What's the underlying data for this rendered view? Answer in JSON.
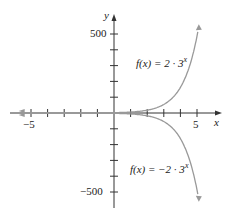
{
  "chart_data": {
    "type": "line",
    "title": "",
    "xlabel": "x",
    "ylabel": "y",
    "xlim": [
      -5.5,
      6
    ],
    "ylim": [
      -550,
      550
    ],
    "x_ticks": [
      -5,
      -4,
      -3,
      -2,
      -1,
      0,
      1,
      2,
      3,
      4,
      5
    ],
    "x_tick_labels": {
      "-5": "−5",
      "5": "5"
    },
    "y_ticks": [
      -500,
      -400,
      -300,
      -200,
      -100,
      0,
      100,
      200,
      300,
      400,
      500
    ],
    "y_tick_labels": {
      "500": "500",
      "-500": "−500"
    },
    "grid": false,
    "series": [
      {
        "name": "f(x) = 2 · 3^x",
        "formula": "2*3^x",
        "label_prefix": "f(x) = 2 · 3",
        "label_exp": "x",
        "color": "#999999",
        "x": [
          -5,
          -4,
          -3,
          -2,
          -1,
          0,
          1,
          2,
          3,
          4,
          5,
          5.1
        ],
        "values": [
          0.008,
          0.025,
          0.074,
          0.22,
          0.67,
          2,
          6,
          18,
          54,
          162,
          486,
          545
        ]
      },
      {
        "name": "f(x) = −2 · 3^x",
        "formula": "-2*3^x",
        "label_prefix": "f(x) = −2 · 3",
        "label_exp": "x",
        "color": "#999999",
        "x": [
          -5,
          -4,
          -3,
          -2,
          -1,
          0,
          1,
          2,
          3,
          4,
          5,
          5.1
        ],
        "values": [
          -0.008,
          -0.025,
          -0.074,
          -0.22,
          -0.67,
          -2,
          -6,
          -18,
          -54,
          -162,
          -486,
          -545
        ]
      }
    ]
  }
}
